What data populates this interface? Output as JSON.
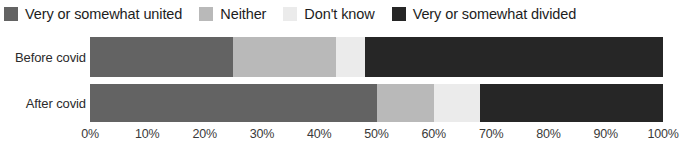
{
  "chart_data": {
    "type": "bar",
    "orientation": "horizontal",
    "stacked": true,
    "normalized": "100%",
    "title": "",
    "subtitle": "",
    "xlabel": "",
    "ylabel": "",
    "xlim": [
      0,
      100
    ],
    "grid": false,
    "legend_position": "top",
    "categories": [
      "Before covid",
      "After covid"
    ],
    "series": [
      {
        "name": "Very or somewhat united",
        "color": "#636363",
        "values": [
          25,
          50
        ]
      },
      {
        "name": "Neither",
        "color": "#b9b9b9",
        "values": [
          18,
          10
        ]
      },
      {
        "name": "Don't know",
        "color": "#ebebeb",
        "values": [
          5,
          8
        ]
      },
      {
        "name": "Very or somewhat divided",
        "color": "#262626",
        "values": [
          52,
          32
        ]
      }
    ],
    "xticks": [
      0,
      10,
      20,
      30,
      40,
      50,
      60,
      70,
      80,
      90,
      100
    ],
    "xticklabels": [
      "0%",
      "10%",
      "20%",
      "30%",
      "40%",
      "50%",
      "60%",
      "70%",
      "80%",
      "90%",
      "100%"
    ]
  },
  "legend": {
    "items": [
      {
        "label": "Very or somewhat united",
        "color": "#636363"
      },
      {
        "label": "Neither",
        "color": "#b9b9b9"
      },
      {
        "label": "Don't know",
        "color": "#ebebeb"
      },
      {
        "label": "Very or somewhat divided",
        "color": "#262626"
      }
    ]
  }
}
